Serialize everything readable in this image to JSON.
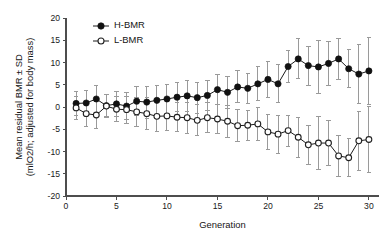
{
  "chart_data": {
    "type": "line",
    "title": "",
    "xlabel": "Generation",
    "ylabel": "Mean residual BMR ± SD (mlO2/h; adjusted for body mass)",
    "ylabel_line1": "Mean residual BMR ± SD",
    "ylabel_line2": "(mlO2/h; adjusted for body mass)",
    "xlim": [
      0,
      31
    ],
    "ylim": [
      -20,
      20
    ],
    "xticks": [
      0,
      5,
      10,
      15,
      20,
      25,
      30
    ],
    "yticks": [
      -20,
      -15,
      -10,
      -5,
      0,
      5,
      10,
      15,
      20
    ],
    "xtick_labels": [
      "0",
      "5",
      "10",
      "15",
      "20",
      "25",
      "30"
    ],
    "ytick_labels": [
      "-20",
      "-15",
      "-10",
      "-5",
      "0",
      "5",
      "10",
      "15",
      "20"
    ],
    "grid": false,
    "legend_position": "top-left",
    "error_type": "SD",
    "x": [
      1,
      2,
      3,
      4,
      5,
      6,
      7,
      8,
      9,
      10,
      11,
      12,
      13,
      14,
      15,
      16,
      17,
      18,
      19,
      20,
      21,
      22,
      23,
      24,
      25,
      26,
      27,
      28,
      29,
      30
    ],
    "series": [
      {
        "name": "H-BMR",
        "marker": "filled-circle",
        "color": "#111111",
        "values": [
          0.8,
          0.9,
          1.8,
          0.3,
          0.7,
          0.2,
          1.3,
          1.1,
          1.5,
          1.8,
          2.2,
          2.5,
          2.1,
          2.6,
          3.9,
          3.3,
          4.5,
          4.2,
          5.2,
          6.2,
          5.2,
          9.1,
          10.8,
          9.3,
          9.0,
          9.8,
          10.8,
          8.6,
          7.4,
          8.1
        ],
        "errors": [
          2.6,
          2.8,
          3.0,
          2.5,
          2.8,
          3.0,
          3.3,
          3.6,
          3.3,
          3.3,
          3.3,
          3.5,
          3.5,
          3.4,
          3.3,
          3.6,
          3.6,
          3.4,
          3.8,
          4.0,
          4.3,
          3.5,
          4.5,
          4.4,
          6.0,
          5.0,
          4.6,
          4.3,
          6.7,
          7.5
        ]
      },
      {
        "name": "L-BMR",
        "marker": "open-circle",
        "color": "#ffffff",
        "values": [
          -0.2,
          -1.5,
          -1.8,
          0.2,
          -0.5,
          -0.6,
          -1.1,
          -1.5,
          -2.1,
          -2.0,
          -2.3,
          -2.4,
          -3.0,
          -2.4,
          -2.7,
          -3.2,
          -4.2,
          -4.1,
          -3.8,
          -5.6,
          -6.1,
          -5.3,
          -6.8,
          -8.5,
          -8.1,
          -8.1,
          -11.0,
          -11.4,
          -7.6,
          -7.3
        ]
      }
    ],
    "legend": [
      {
        "label": "H-BMR",
        "marker": "filled-circle"
      },
      {
        "label": "L-BMR",
        "marker": "open-circle"
      }
    ]
  }
}
